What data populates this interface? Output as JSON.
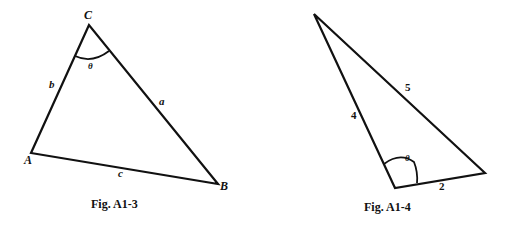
{
  "figures": [
    {
      "caption": "Fig. A1-3",
      "vertices": {
        "A": "A",
        "B": "B",
        "C": "C"
      },
      "sides": {
        "a": "a",
        "b": "b",
        "c": "c"
      },
      "angle": "θ"
    },
    {
      "caption": "Fig. A1-4",
      "sides": {
        "left": "4",
        "hyp": "5",
        "base": "2"
      },
      "angle": "θ"
    }
  ],
  "colors": {
    "stroke": "#111111",
    "background": "#ffffff"
  }
}
